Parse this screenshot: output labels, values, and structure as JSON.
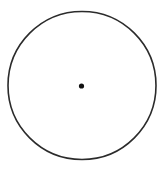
{
  "diagram": {
    "type": "circle-with-center",
    "circle": {
      "cx": 82,
      "cy": 85.5,
      "r": 74,
      "stroke": "#2b2b2b",
      "stroke_width": 1.6,
      "fill": "none"
    },
    "center_point": {
      "cx": 81.5,
      "cy": 86,
      "r": 2.6,
      "fill": "#111111"
    }
  }
}
